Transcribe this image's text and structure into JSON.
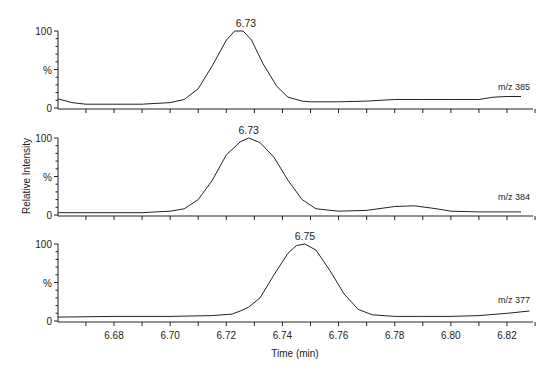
{
  "chart_data": {
    "type": "line",
    "title": "",
    "xlabel": "Time (min)",
    "ylabel": "Relative Intensity",
    "xlim": [
      6.66,
      6.83
    ],
    "x_ticks": [
      "6.68",
      "6.70",
      "6.72",
      "6.74",
      "6.76",
      "6.78",
      "6.80",
      "6.82"
    ],
    "y_tick_labels": [
      "0",
      "%",
      "100"
    ],
    "ylim": [
      0,
      100
    ],
    "grid": false,
    "legend": "none",
    "panels": [
      {
        "label": "m/z 385",
        "peak_label": "6.73",
        "peak_time": 6.727,
        "x": [
          6.66,
          6.665,
          6.67,
          6.68,
          6.69,
          6.695,
          6.7,
          6.705,
          6.71,
          6.715,
          6.72,
          6.723,
          6.726,
          6.729,
          6.733,
          6.738,
          6.742,
          6.747,
          6.75,
          6.76,
          6.77,
          6.78,
          6.79,
          6.8,
          6.81,
          6.815,
          6.82,
          6.825
        ],
        "y": [
          12,
          7,
          5,
          5,
          5,
          6,
          7,
          11,
          25,
          55,
          88,
          100,
          100,
          88,
          58,
          28,
          14,
          9,
          8,
          8,
          9,
          11,
          11,
          11,
          11,
          14,
          15,
          15
        ]
      },
      {
        "label": "m/z 384",
        "peak_label": "6.73",
        "peak_time": 6.728,
        "x": [
          6.66,
          6.67,
          6.68,
          6.69,
          6.695,
          6.7,
          6.705,
          6.71,
          6.715,
          6.72,
          6.725,
          6.728,
          6.732,
          6.737,
          6.742,
          6.747,
          6.752,
          6.76,
          6.77,
          6.78,
          6.787,
          6.795,
          6.8,
          6.81,
          6.82,
          6.825
        ],
        "y": [
          3,
          3,
          3,
          3,
          4,
          5,
          8,
          20,
          45,
          78,
          95,
          100,
          94,
          75,
          45,
          20,
          8,
          5,
          6,
          11,
          12,
          8,
          5,
          4,
          4,
          4
        ]
      },
      {
        "label": "m/z 377",
        "peak_label": "6.75",
        "peak_time": 6.748,
        "x": [
          6.66,
          6.68,
          6.7,
          6.715,
          6.722,
          6.725,
          6.728,
          6.732,
          6.737,
          6.742,
          6.745,
          6.748,
          6.752,
          6.757,
          6.762,
          6.767,
          6.772,
          6.78,
          6.79,
          6.8,
          6.81,
          6.82,
          6.828
        ],
        "y": [
          5,
          6,
          6,
          7,
          9,
          13,
          18,
          30,
          60,
          88,
          98,
          100,
          92,
          65,
          35,
          15,
          8,
          6,
          6,
          6,
          7,
          10,
          13
        ]
      }
    ]
  }
}
